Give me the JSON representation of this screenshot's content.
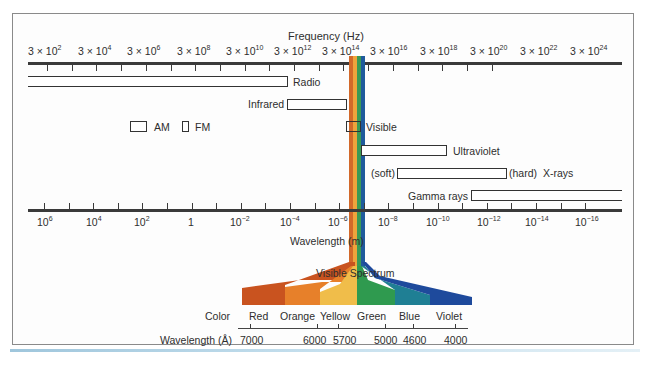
{
  "title": "Frequency (Hz)",
  "frequency_axis": {
    "label": "Frequency (Hz)",
    "ticks": [
      {
        "base": "3 × 10",
        "exp": "2"
      },
      {
        "base": "3 × 10",
        "exp": "4"
      },
      {
        "base": "3 × 10",
        "exp": "6"
      },
      {
        "base": "3 × 10",
        "exp": "8"
      },
      {
        "base": "3 × 10",
        "exp": "10"
      },
      {
        "base": "3 × 10",
        "exp": "12"
      },
      {
        "base": "3 × 10",
        "exp": "14"
      },
      {
        "base": "3 × 10",
        "exp": "16"
      },
      {
        "base": "3 × 10",
        "exp": "18"
      },
      {
        "base": "3 × 10",
        "exp": "20"
      },
      {
        "base": "3 × 10",
        "exp": "22"
      },
      {
        "base": "3 × 10",
        "exp": "24"
      }
    ]
  },
  "wavelength_axis": {
    "label": "Wavelength (m)",
    "ticks": [
      {
        "base": "10",
        "exp": "6"
      },
      {
        "base": "10",
        "exp": "4"
      },
      {
        "base": "10",
        "exp": "2"
      },
      {
        "base": "1",
        "exp": ""
      },
      {
        "base": "10",
        "exp": "−2"
      },
      {
        "base": "10",
        "exp": "−4"
      },
      {
        "base": "10",
        "exp": "−6"
      },
      {
        "base": "10",
        "exp": "−8"
      },
      {
        "base": "10",
        "exp": "−10"
      },
      {
        "base": "10",
        "exp": "−12"
      },
      {
        "base": "10",
        "exp": "−14"
      },
      {
        "base": "10",
        "exp": "−16"
      }
    ]
  },
  "bands": {
    "radio": "Radio",
    "infrared": "Infrared",
    "am": "AM",
    "fm": "FM",
    "visible": "Visible",
    "ultraviolet": "Ultraviolet",
    "xrays_soft": "(soft)",
    "xrays_hard": "(hard)",
    "xrays": "X-rays",
    "gamma": "Gamma rays"
  },
  "visible_spectrum": {
    "label": "Visible Spectrum",
    "color_label": "Color",
    "wavelength_label": "Wavelength (Å)",
    "colors": [
      {
        "name": "Red",
        "hex": "#c9531f"
      },
      {
        "name": "Orange",
        "hex": "#e7802a"
      },
      {
        "name": "Yellow",
        "hex": "#f0bd4a"
      },
      {
        "name": "Green",
        "hex": "#2f9a4f"
      },
      {
        "name": "Blue",
        "hex": "#1f7f94"
      },
      {
        "name": "Violet",
        "hex": "#1e4a9c"
      }
    ],
    "wavelengths": [
      "7000",
      "6000",
      "5700",
      "5000",
      "4600",
      "4000"
    ]
  }
}
